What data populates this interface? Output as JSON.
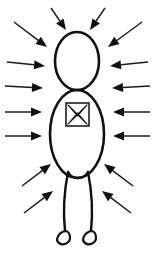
{
  "figure": {
    "canvas": {
      "width": 154,
      "height": 253,
      "background": "#ffffff"
    },
    "ink_color": "#111111",
    "parts": {
      "head": {
        "label": "head",
        "shape": "ellipse",
        "cx": 77,
        "cy": 61,
        "rx": 22,
        "ry": 29
      },
      "torso": {
        "label": "torso",
        "shape": "ellipse",
        "cx": 77,
        "cy": 134,
        "rx": 27,
        "ry": 44
      },
      "chest_box": {
        "label": "chest box",
        "shape": "square-with-crossed-pattern",
        "x": 66,
        "y": 103,
        "width": 23,
        "height": 23
      },
      "left_leg": {
        "label": "left leg"
      },
      "right_leg": {
        "label": "right leg"
      },
      "left_foot": {
        "label": "left foot"
      },
      "right_foot": {
        "label": "right foot"
      }
    },
    "arrows": {
      "description": "Twelve arrows converging inward toward the figure",
      "count": 12,
      "color": "#1a1a1a",
      "groups": [
        {
          "name": "top",
          "count": 4,
          "direction": "down-inward"
        },
        {
          "name": "left",
          "count": 4,
          "direction": "rightward"
        },
        {
          "name": "right",
          "count": 4,
          "direction": "leftward"
        },
        {
          "name": "bottom",
          "count": 4,
          "direction": "up-inward"
        }
      ],
      "items": [
        {
          "id": "arrow-top-left-outer",
          "group": "top",
          "x1": 14,
          "y1": 22,
          "x2": 47,
          "y2": 47
        },
        {
          "id": "arrow-top-left-inner",
          "group": "top",
          "x1": 51,
          "y1": 8,
          "x2": 66,
          "y2": 30
        },
        {
          "id": "arrow-top-right-inner",
          "group": "top",
          "x1": 105,
          "y1": 8,
          "x2": 90,
          "y2": 30
        },
        {
          "id": "arrow-top-right-outer",
          "group": "top",
          "x1": 142,
          "y1": 22,
          "x2": 108,
          "y2": 47
        },
        {
          "id": "arrow-left-1",
          "group": "left",
          "x1": 7,
          "y1": 62,
          "x2": 45,
          "y2": 66
        },
        {
          "id": "arrow-left-2",
          "group": "left",
          "x1": 5,
          "y1": 86,
          "x2": 43,
          "y2": 88
        },
        {
          "id": "arrow-left-3",
          "group": "left",
          "x1": 5,
          "y1": 112,
          "x2": 42,
          "y2": 112
        },
        {
          "id": "arrow-left-4",
          "group": "left",
          "x1": 5,
          "y1": 136,
          "x2": 42,
          "y2": 136
        },
        {
          "id": "arrow-right-1",
          "group": "right",
          "x1": 148,
          "y1": 62,
          "x2": 110,
          "y2": 66
        },
        {
          "id": "arrow-right-2",
          "group": "right",
          "x1": 150,
          "y1": 86,
          "x2": 112,
          "y2": 88
        },
        {
          "id": "arrow-right-3",
          "group": "right",
          "x1": 150,
          "y1": 112,
          "x2": 113,
          "y2": 112
        },
        {
          "id": "arrow-right-4",
          "group": "right",
          "x1": 150,
          "y1": 136,
          "x2": 113,
          "y2": 136
        },
        {
          "id": "arrow-bottom-left-1",
          "group": "bottom",
          "x1": 22,
          "y1": 186,
          "x2": 51,
          "y2": 164
        },
        {
          "id": "arrow-bottom-left-2",
          "group": "bottom",
          "x1": 24,
          "y1": 213,
          "x2": 53,
          "y2": 191
        },
        {
          "id": "arrow-bottom-right-1",
          "group": "bottom",
          "x1": 133,
          "y1": 186,
          "x2": 104,
          "y2": 164
        },
        {
          "id": "arrow-bottom-right-2",
          "group": "bottom",
          "x1": 131,
          "y1": 213,
          "x2": 102,
          "y2": 191
        }
      ]
    }
  }
}
